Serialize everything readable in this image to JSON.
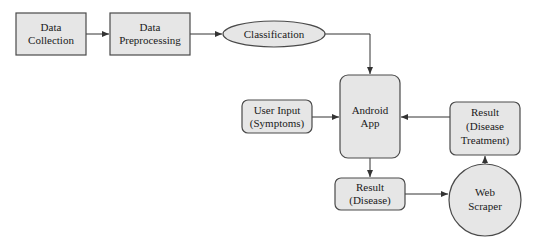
{
  "diagram": {
    "type": "flowchart",
    "nodes": {
      "data_collection": {
        "lines": [
          "Data",
          "Collection"
        ],
        "shape": "rectangle"
      },
      "data_preprocessing": {
        "lines": [
          "Data",
          "Preprocessing"
        ],
        "shape": "rectangle"
      },
      "classification": {
        "lines": [
          "Classification"
        ],
        "shape": "ellipse"
      },
      "android_app": {
        "lines": [
          "Android",
          "App"
        ],
        "shape": "rounded-rectangle"
      },
      "user_input": {
        "lines": [
          "User Input",
          "(Symptoms)"
        ],
        "shape": "rounded-rectangle"
      },
      "result_treatment": {
        "lines": [
          "Result",
          "(Disease",
          "Treatment)"
        ],
        "shape": "rounded-rectangle"
      },
      "result_disease": {
        "lines": [
          "Result",
          "(Disease)"
        ],
        "shape": "rounded-rectangle"
      },
      "web_scraper": {
        "lines": [
          "Web",
          "Scraper"
        ],
        "shape": "circle"
      }
    },
    "edges": [
      {
        "from": "Data Collection",
        "to": "Data Preprocessing"
      },
      {
        "from": "Data Preprocessing",
        "to": "Classification"
      },
      {
        "from": "Classification",
        "to": "Android App"
      },
      {
        "from": "User Input (Symptoms)",
        "to": "Android App"
      },
      {
        "from": "Result (Disease Treatment)",
        "to": "Android App"
      },
      {
        "from": "Android App",
        "to": "Result (Disease)"
      },
      {
        "from": "Result (Disease)",
        "to": "Web Scraper"
      },
      {
        "from": "Web Scraper",
        "to": "Result (Disease Treatment)"
      }
    ],
    "colors": {
      "fill": "#e6e6e6",
      "stroke": "#4a4a4a",
      "text": "#1a1a1a"
    }
  }
}
